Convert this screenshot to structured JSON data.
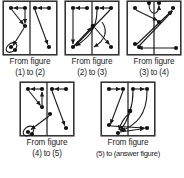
{
  "page": {
    "kind": "figure-series-puzzle",
    "background_color": "#ffffff",
    "ink_color": "#1a1a1a"
  },
  "style": {
    "box_stroke": "#2b2b2b",
    "divider_stroke": "#2b2b2b",
    "arrow_stroke": "#1a1a1a",
    "node_fill": "#111111"
  },
  "panels": [
    {
      "id": "panel-1",
      "caption_line1": "From figure",
      "caption_line2": "(1) to (2)",
      "nodes": [
        {
          "id": "n1",
          "x": 9,
          "y": 8
        },
        {
          "id": "n2",
          "x": 23,
          "y": 8
        },
        {
          "id": "n3",
          "x": 33,
          "y": 8
        },
        {
          "id": "n4",
          "x": 47,
          "y": 8
        },
        {
          "id": "n5",
          "x": 23,
          "y": 26
        },
        {
          "id": "n6",
          "x": 9,
          "y": 47
        },
        {
          "id": "n7",
          "x": 47,
          "y": 47
        }
      ],
      "arrows": [
        {
          "from": "n2",
          "to": "n1",
          "type": "straight"
        },
        {
          "from": "n1",
          "to": "n5",
          "type": "straight"
        },
        {
          "from": "n2",
          "to": "n5",
          "type": "straight"
        },
        {
          "from": "n4",
          "to": "n3",
          "type": "straight"
        },
        {
          "from": "n3",
          "to": "n7",
          "type": "straight"
        },
        {
          "from": "n5",
          "to": "n6",
          "type": "straight"
        },
        {
          "from": "n6",
          "to": "n6",
          "type": "loop"
        }
      ]
    },
    {
      "id": "panel-2",
      "caption_line1": "From figure",
      "caption_line2": "(2) to (3)",
      "nodes": [
        {
          "id": "n1",
          "x": 9,
          "y": 8
        },
        {
          "id": "n2",
          "x": 23,
          "y": 8
        },
        {
          "id": "n3",
          "x": 33,
          "y": 8
        },
        {
          "id": "n4",
          "x": 47,
          "y": 8
        },
        {
          "id": "n5",
          "x": 29,
          "y": 26
        },
        {
          "id": "n6",
          "x": 9,
          "y": 47
        },
        {
          "id": "n7",
          "x": 47,
          "y": 47
        }
      ],
      "arrows": [
        {
          "from": "n2",
          "to": "n1",
          "type": "straight"
        },
        {
          "from": "n4",
          "to": "n3",
          "type": "straight"
        },
        {
          "from": "n1",
          "to": "n6",
          "type": "straight"
        },
        {
          "from": "n6",
          "to": "n5",
          "type": "straight"
        },
        {
          "from": "n5",
          "to": "n7",
          "type": "straight"
        },
        {
          "from": "n4",
          "to": "n6",
          "type": "straight"
        },
        {
          "from": "n3",
          "to": "n6",
          "type": "curve"
        },
        {
          "from": "n5",
          "to": "n6",
          "type": "curve"
        }
      ]
    },
    {
      "id": "panel-3",
      "caption_line1": "From figure",
      "caption_line2": "(3) to (4)",
      "nodes": [
        {
          "id": "n1",
          "x": 9,
          "y": 8
        },
        {
          "id": "n2",
          "x": 23,
          "y": 4
        },
        {
          "id": "n3",
          "x": 33,
          "y": 4
        },
        {
          "id": "n4",
          "x": 47,
          "y": 8
        },
        {
          "id": "n5",
          "x": 33,
          "y": 22
        },
        {
          "id": "n6",
          "x": 9,
          "y": 44
        },
        {
          "id": "n7",
          "x": 22,
          "y": 44
        },
        {
          "id": "n8",
          "x": 50,
          "y": 44
        }
      ],
      "arrows": [
        {
          "from": "n1",
          "to": "n5",
          "type": "straight"
        },
        {
          "from": "n6",
          "to": "n4",
          "type": "straight"
        },
        {
          "from": "n7",
          "to": "n4",
          "type": "straight"
        },
        {
          "from": "n2",
          "to": "n3",
          "type": "curve"
        },
        {
          "from": "n8",
          "to": "n6",
          "type": "straight"
        }
      ]
    },
    {
      "id": "panel-4",
      "caption_line1": "From figure",
      "caption_line2": "(4) to (5)",
      "nodes": [
        {
          "id": "n1",
          "x": 9,
          "y": 8
        },
        {
          "id": "n2",
          "x": 23,
          "y": 8
        },
        {
          "id": "n3",
          "x": 33,
          "y": 8
        },
        {
          "id": "n4",
          "x": 47,
          "y": 8
        },
        {
          "id": "n5",
          "x": 23,
          "y": 26
        },
        {
          "id": "n6",
          "x": 31,
          "y": 33
        },
        {
          "id": "n7",
          "x": 9,
          "y": 50
        },
        {
          "id": "n8",
          "x": 47,
          "y": 47
        }
      ],
      "arrows": [
        {
          "from": "n2",
          "to": "n1",
          "type": "straight"
        },
        {
          "from": "n1",
          "to": "n5",
          "type": "straight"
        },
        {
          "from": "n2",
          "to": "n5",
          "type": "straight"
        },
        {
          "from": "n4",
          "to": "n3",
          "type": "straight"
        },
        {
          "from": "n3",
          "to": "n8",
          "type": "straight"
        },
        {
          "from": "n6",
          "to": "n7",
          "type": "straight"
        },
        {
          "from": "n7",
          "to": "n7",
          "type": "loop"
        }
      ]
    },
    {
      "id": "panel-5",
      "caption_line1": "From figure",
      "caption_line2": "(5) to (answer figure)",
      "nodes": [
        {
          "id": "n1",
          "x": 9,
          "y": 8
        },
        {
          "id": "n2",
          "x": 23,
          "y": 8
        },
        {
          "id": "n3",
          "x": 33,
          "y": 8
        },
        {
          "id": "n4",
          "x": 47,
          "y": 8
        },
        {
          "id": "n5",
          "x": 30,
          "y": 30
        },
        {
          "id": "n6",
          "x": 9,
          "y": 44
        },
        {
          "id": "n7",
          "x": 18,
          "y": 51
        },
        {
          "id": "n8",
          "x": 47,
          "y": 47
        }
      ],
      "arrows": [
        {
          "from": "n1",
          "to": "n2",
          "type": "straight"
        },
        {
          "from": "n3",
          "to": "n4",
          "type": "straight"
        },
        {
          "from": "n2",
          "to": "n6",
          "type": "straight"
        },
        {
          "from": "n4",
          "to": "n7",
          "type": "curve"
        },
        {
          "from": "n3",
          "to": "n7",
          "type": "curve"
        },
        {
          "from": "n6",
          "to": "n8",
          "type": "straight"
        },
        {
          "from": "n5",
          "to": "n7",
          "type": "curve"
        },
        {
          "from": "n7",
          "to": "n8",
          "type": "straight"
        }
      ]
    }
  ]
}
